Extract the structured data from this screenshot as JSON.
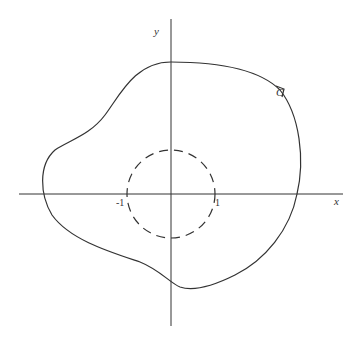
{
  "diagram": {
    "axes": {
      "x_label": "x",
      "y_label": "y"
    },
    "unit_circle": {
      "style": "dashed",
      "radius": 1,
      "tick_labels": [
        "-1",
        "1"
      ]
    },
    "contour": {
      "label": "C",
      "orientation": "counterclockwise",
      "description": "closed curve enclosing the unit circle"
    }
  }
}
